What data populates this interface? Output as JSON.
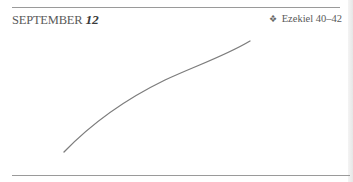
{
  "header": {
    "month": "SEPTEMBER",
    "day": "12",
    "reading_bullet": "❖",
    "reading": "Ezekiel 40–42"
  },
  "sketch": {
    "description": "hand-drawn pencil curve",
    "stroke_color": "#6e6e6e",
    "points": [
      [
        64,
        152
      ],
      [
        100,
        118
      ],
      [
        150,
        87
      ],
      [
        200,
        63
      ],
      [
        250,
        41
      ]
    ]
  }
}
